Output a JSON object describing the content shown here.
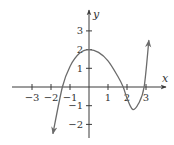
{
  "chart_data": {
    "type": "line",
    "title": "",
    "xlabel": "x",
    "ylabel": "y",
    "xlim": [
      -3.5,
      3.8
    ],
    "ylim": [
      -2.8,
      3.8
    ],
    "grid": false,
    "legend": null,
    "x_ticks": [
      -3,
      -2,
      -1,
      1,
      2,
      3
    ],
    "x_tick_labels": [
      "−3",
      "−2",
      "−1",
      "1",
      "2",
      "3"
    ],
    "y_ticks": [
      -2,
      -1,
      1,
      2,
      3
    ],
    "y_tick_labels": [
      "−2",
      "−1",
      "1",
      "2",
      "3"
    ],
    "series": [
      {
        "name": "curve (approximate points read from image)",
        "x": [
          -1.9,
          -1.4,
          -1.0,
          -0.5,
          0.0,
          0.5,
          1.0,
          1.5,
          1.8,
          2.0,
          2.3,
          2.6,
          2.9,
          3.15
        ],
        "y": [
          -2.5,
          0.0,
          1.1,
          1.8,
          2.0,
          1.85,
          1.4,
          0.6,
          0.0,
          -0.6,
          -1.2,
          -0.9,
          0.0,
          2.5
        ],
        "arrows": "both"
      }
    ],
    "features": {
      "local_max": [
        0,
        2
      ],
      "local_min_approx": [
        2.3,
        -1.2
      ],
      "x_intercepts_approx": [
        -1.4,
        1.8,
        2.9
      ],
      "y_intercept": 2
    }
  },
  "axes": {
    "x_label": "x",
    "y_label": "y"
  }
}
